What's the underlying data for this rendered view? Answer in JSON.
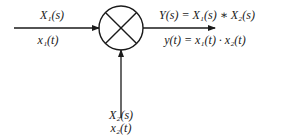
{
  "diagram": {
    "type": "multiplier-block",
    "node": {
      "symbol": "multiply-cross-circle",
      "cx": 121,
      "cy": 28,
      "r": 22
    },
    "input1": {
      "freq_label": "X₁(s)",
      "time_label": "x₁(t)"
    },
    "input2": {
      "freq_label": "X₂(s)",
      "time_label": "x₂(t)"
    },
    "output": {
      "freq_label": "Y(s) = X₁(s) ∗ X₂(s)",
      "time_label": "y(t) = x₁(t) · x₂(t)"
    },
    "colors": {
      "stroke": "#1a1a1a",
      "background": "#ffffff"
    }
  }
}
